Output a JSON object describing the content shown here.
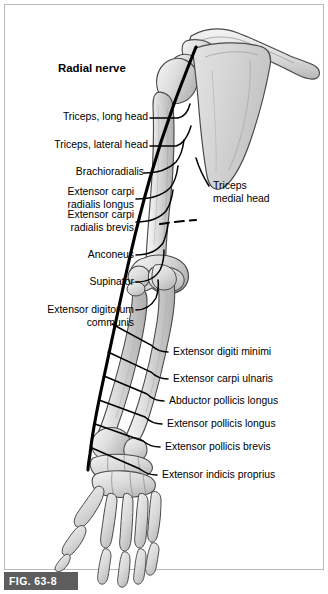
{
  "figure": {
    "caption_id": "FIG. 63-8",
    "title": "Radial nerve",
    "background_color": "#ffffff",
    "frame_color": "#b9b9b9",
    "caption_band_color": "#5d5d5d",
    "nerve_color": "#000000",
    "bone_fill_light": "#f2f2f2",
    "bone_fill_mid": "#d5d5d5",
    "bone_fill_dark": "#b4b4b4",
    "bone_outline": "#4a4a4a"
  },
  "labels_left": [
    {
      "id": "triceps-long-head",
      "lines": [
        "Triceps, long head"
      ],
      "x": 148,
      "y": 117
    },
    {
      "id": "triceps-lateral-head",
      "lines": [
        "Triceps, lateral head"
      ],
      "x": 148,
      "y": 145
    },
    {
      "id": "brachioradialis",
      "lines": [
        "Brachioradialis"
      ],
      "x": 140,
      "y": 172
    },
    {
      "id": "extensor-carpi-radialis-longus",
      "lines": [
        "Extensor carpi",
        "radialis longus"
      ],
      "x": 134,
      "y": 187
    },
    {
      "id": "extensor-carpi-radialis-brevis",
      "lines": [
        "Extensor carpi",
        "radialis brevis"
      ],
      "x": 134,
      "y": 215
    },
    {
      "id": "anconeus",
      "lines": [
        "Anconeus"
      ],
      "x": 134,
      "y": 254
    },
    {
      "id": "supinator",
      "lines": [
        "Supinator"
      ],
      "x": 134,
      "y": 281
    },
    {
      "id": "extensor-digitorum-communis",
      "lines": [
        "Extensor digitorum",
        "communis"
      ],
      "x": 134,
      "y": 308
    }
  ],
  "labels_right": [
    {
      "id": "triceps-medial-head",
      "lines": [
        "Triceps",
        "medial head"
      ],
      "x": 213,
      "y": 185
    },
    {
      "id": "extensor-digiti-minimi",
      "lines": [
        "Extensor digiti minimi"
      ],
      "x": 171,
      "y": 351
    },
    {
      "id": "extensor-carpi-ulnaris",
      "lines": [
        "Extensor carpi ulnaris"
      ],
      "x": 171,
      "y": 378
    },
    {
      "id": "abductor-pollicis-longus",
      "lines": [
        "Abductor pollicis longus"
      ],
      "x": 167,
      "y": 400
    },
    {
      "id": "extensor-pollicis-longus",
      "lines": [
        "Extensor pollicis longus"
      ],
      "x": 165,
      "y": 423
    },
    {
      "id": "extensor-pollicis-brevis",
      "lines": [
        "Extensor pollicis brevis"
      ],
      "x": 163,
      "y": 446
    },
    {
      "id": "extensor-indicis-proprius",
      "lines": [
        "Extensor indicis proprius"
      ],
      "x": 160,
      "y": 474
    }
  ],
  "bones": [
    {
      "id": "clavicle",
      "name": "clavicle"
    },
    {
      "id": "scapula",
      "name": "scapula"
    },
    {
      "id": "acromion",
      "name": "acromion"
    },
    {
      "id": "humerus",
      "name": "humerus"
    },
    {
      "id": "radius",
      "name": "radius"
    },
    {
      "id": "ulna",
      "name": "ulna"
    },
    {
      "id": "carpals",
      "name": "carpal-bones"
    },
    {
      "id": "metacarpals",
      "name": "metacarpal-bones"
    },
    {
      "id": "phalanges",
      "name": "phalanges"
    }
  ]
}
